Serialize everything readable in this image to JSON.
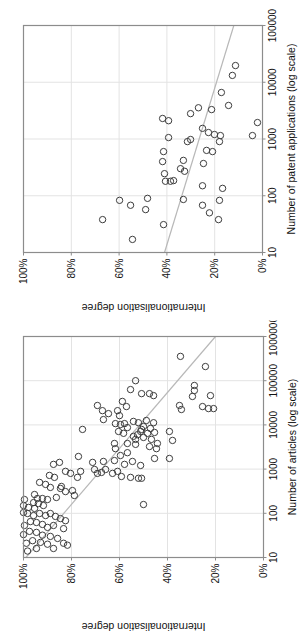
{
  "colors": {
    "background": "#ffffff",
    "plot_border": "#8c8c8c",
    "gridline": "#e3e3e3",
    "trend_line": "#b8b8b8",
    "marker_outline": "#3d3d3d",
    "text": "#111111"
  },
  "chart_data": [
    {
      "type": "scatter",
      "title": "",
      "xlabel": "Number of patent applications (log scale)",
      "ylabel": "Internationalisation degree",
      "x_scale": "log",
      "xlim": [
        10,
        100000
      ],
      "ylim": [
        0,
        100
      ],
      "x_ticks": [
        "10",
        "100",
        "1000",
        "10000",
        "100000"
      ],
      "y_ticks": [
        "0%",
        "20%",
        "40%",
        "60%",
        "80%",
        "100%"
      ],
      "grid": "on",
      "legend": "none",
      "orientation": "rotated 90 degrees counter-clockwise on page",
      "trend_line": {
        "x1": 10,
        "y1": 41,
        "x2": 100000,
        "y2": 12
      },
      "points": [
        [
          19700,
          11.3
        ],
        [
          13200,
          12.6
        ],
        [
          6600,
          17.2
        ],
        [
          3900,
          14.2
        ],
        [
          3300,
          21.3
        ],
        [
          3550,
          26.8
        ],
        [
          2800,
          30.1
        ],
        [
          2300,
          41.8
        ],
        [
          2100,
          39.3
        ],
        [
          1950,
          2.1
        ],
        [
          1150,
          4.2
        ],
        [
          1540,
          25.1
        ],
        [
          1300,
          22.6
        ],
        [
          1200,
          20.1
        ],
        [
          1150,
          17.6
        ],
        [
          1060,
          39.3
        ],
        [
          980,
          30.1
        ],
        [
          900,
          31.4
        ],
        [
          900,
          18
        ],
        [
          630,
          23.4
        ],
        [
          600,
          20.9
        ],
        [
          600,
          41.4
        ],
        [
          400,
          41.8
        ],
        [
          420,
          33.1
        ],
        [
          370,
          24.7
        ],
        [
          300,
          34.3
        ],
        [
          270,
          32.6
        ],
        [
          245,
          41
        ],
        [
          180,
          38.5
        ],
        [
          180,
          40.6
        ],
        [
          185,
          37.2
        ],
        [
          150,
          25.1
        ],
        [
          135,
          16.7
        ],
        [
          86,
          33.1
        ],
        [
          83,
          18
        ],
        [
          68,
          25.1
        ],
        [
          90,
          48.1
        ],
        [
          83,
          59.8
        ],
        [
          68,
          55.2
        ],
        [
          57,
          48.9
        ],
        [
          50,
          22.2
        ],
        [
          38,
          18.4
        ],
        [
          38,
          66.9
        ],
        [
          31,
          41.4
        ],
        [
          17,
          54.4
        ]
      ]
    },
    {
      "type": "scatter",
      "title": "",
      "xlabel": "Number of articles (log scale)",
      "ylabel": "Internationalisation degree",
      "x_scale": "log",
      "xlim": [
        10,
        1000000
      ],
      "ylim": [
        0,
        100
      ],
      "x_ticks": [
        "10",
        "100",
        "1000",
        "10000",
        "100000",
        "1000000"
      ],
      "y_ticks": [
        "0%",
        "20%",
        "40%",
        "60%",
        "80%",
        "100%"
      ],
      "grid": "on",
      "legend": "none",
      "orientation": "rotated 90 degrees counter-clockwise on page",
      "trend_line": {
        "x1": 10,
        "y1": 99,
        "x2": 1000000,
        "y2": 20
      },
      "points": [
        [
          100000,
          53.3
        ],
        [
          63000,
          55.4
        ],
        [
          51000,
          50.8
        ],
        [
          34000,
          58.8
        ],
        [
          26000,
          57.1
        ],
        [
          27500,
          69.2
        ],
        [
          21000,
          67.1
        ],
        [
          21000,
          60.8
        ],
        [
          18000,
          64.6
        ],
        [
          16200,
          60
        ],
        [
          13200,
          66.7
        ],
        [
          7900,
          75.4
        ],
        [
          10700,
          61.7
        ],
        [
          10200,
          59.6
        ],
        [
          10700,
          57.9
        ],
        [
          8700,
          56.7
        ],
        [
          7100,
          60.4
        ],
        [
          6450,
          58.3
        ],
        [
          12000,
          54.2
        ],
        [
          11200,
          52.1
        ],
        [
          7900,
          50.8
        ],
        [
          6000,
          52.5
        ],
        [
          5500,
          54.2
        ],
        [
          4700,
          53.3
        ],
        [
          3800,
          62.1
        ],
        [
          3800,
          56.7
        ],
        [
          3630,
          53.3
        ],
        [
          3240,
          47.5
        ],
        [
          355000,
          34.6
        ],
        [
          209000,
          24.2
        ],
        [
          51000,
          47.5
        ],
        [
          46000,
          45.8
        ],
        [
          78000,
          28.8
        ],
        [
          60000,
          28.8
        ],
        [
          44000,
          29.6
        ],
        [
          46000,
          22.1
        ],
        [
          26000,
          25.4
        ],
        [
          23400,
          22.9
        ],
        [
          23400,
          20.8
        ],
        [
          27500,
          35
        ],
        [
          22300,
          34.2
        ],
        [
          12600,
          48.8
        ],
        [
          11200,
          45.8
        ],
        [
          9200,
          50
        ],
        [
          8300,
          47.1
        ],
        [
          7100,
          51.2
        ],
        [
          6450,
          48.3
        ],
        [
          6750,
          45.4
        ],
        [
          5200,
          50
        ],
        [
          4700,
          46.7
        ],
        [
          3800,
          44.2
        ],
        [
          7100,
          39.2
        ],
        [
          4450,
          37.9
        ],
        [
          2900,
          61.7
        ],
        [
          2350,
          56.7
        ],
        [
          2030,
          59.6
        ],
        [
          1930,
          77.1
        ],
        [
          1490,
          66.7
        ],
        [
          1420,
          71.2
        ],
        [
          1420,
          85
        ],
        [
          1280,
          87.5
        ],
        [
          1560,
          62.1
        ],
        [
          1490,
          54.6
        ],
        [
          1280,
          57.9
        ],
        [
          1210,
          51.2
        ],
        [
          720,
          89.2
        ],
        [
          650,
          87.1
        ],
        [
          890,
          82.5
        ],
        [
          800,
          80.4
        ],
        [
          890,
          76.2
        ],
        [
          650,
          77.5
        ],
        [
          980,
          70.4
        ],
        [
          800,
          69.2
        ],
        [
          840,
          67.5
        ],
        [
          980,
          65.8
        ],
        [
          800,
          62.9
        ],
        [
          890,
          60.8
        ],
        [
          680,
          59.2
        ],
        [
          650,
          55.4
        ],
        [
          620,
          52.1
        ],
        [
          500,
          93.3
        ],
        [
          450,
          90.8
        ],
        [
          385,
          88.8
        ],
        [
          365,
          84.6
        ],
        [
          405,
          84.2
        ],
        [
          310,
          82.5
        ],
        [
          327,
          79.6
        ],
        [
          253,
          78.8
        ],
        [
          228,
          86.3
        ],
        [
          266,
          95.4
        ],
        [
          216,
          94.2
        ],
        [
          216,
          92.1
        ],
        [
          205,
          90
        ],
        [
          175,
          95.8
        ],
        [
          166,
          93.8
        ],
        [
          150,
          91.7
        ],
        [
          205,
          99.6
        ],
        [
          150,
          100
        ],
        [
          136,
          97.9
        ],
        [
          129,
          95.4
        ],
        [
          104,
          100
        ],
        [
          99,
          98.3
        ],
        [
          89,
          95.8
        ],
        [
          99,
          93.3
        ],
        [
          89,
          90.8
        ],
        [
          99,
          88.8
        ],
        [
          85,
          86.7
        ],
        [
          76,
          84.6
        ],
        [
          68,
          82.5
        ],
        [
          65,
          97.1
        ],
        [
          62,
          94.6
        ],
        [
          56,
          92.1
        ],
        [
          53,
          99.6
        ],
        [
          48,
          90
        ],
        [
          53,
          87.5
        ],
        [
          45,
          83.3
        ],
        [
          39,
          97.5
        ],
        [
          37,
          94.6
        ],
        [
          33,
          100
        ],
        [
          32,
          92.1
        ],
        [
          30,
          88.8
        ],
        [
          27,
          85.8
        ],
        [
          24,
          96.2
        ],
        [
          22,
          92.9
        ],
        [
          21,
          98.8
        ],
        [
          20,
          90
        ],
        [
          21,
          83.3
        ],
        [
          19,
          81.7
        ],
        [
          16,
          87.5
        ],
        [
          16,
          94.6
        ],
        [
          14,
          98.3
        ],
        [
          2900,
          44.6
        ],
        [
          1740,
          45.4
        ],
        [
          1740,
          39.2
        ],
        [
          620,
          50.8
        ],
        [
          158,
          50
        ]
      ]
    }
  ]
}
